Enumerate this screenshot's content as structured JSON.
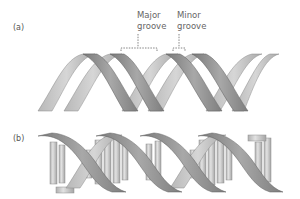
{
  "figure": {
    "panel_a": {
      "label": "(a)",
      "description": "DNA double helix ribbon model showing the two sugar-phosphate backbones",
      "annotations": [
        {
          "line1": "Major",
          "line2": "groove"
        },
        {
          "line1": "Minor",
          "line2": "groove"
        }
      ]
    },
    "panel_b": {
      "label": "(b)",
      "description": "DNA double helix with base pairs drawn as cylinders between backbones"
    },
    "colors": {
      "ribbon_front": "#8c8c8c",
      "ribbon_back": "#b5b5b5",
      "ribbon_edge": "#6e6e6e",
      "base_pair": "#c9c9c9",
      "annotation": "#666666"
    }
  }
}
